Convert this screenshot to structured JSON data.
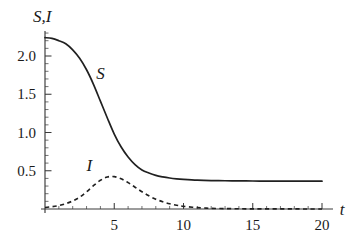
{
  "chart_data": {
    "type": "line",
    "title": "",
    "xlabel": "t",
    "ylabel": "S,I",
    "xlim": [
      0,
      20
    ],
    "ylim": [
      0,
      2.35
    ],
    "grid": false,
    "legend_position": "inline-annotations",
    "xticks": [
      5,
      10,
      15,
      20
    ],
    "xtick_labels": [
      "5",
      "10",
      "15",
      "20"
    ],
    "xminor_step": 1,
    "yticks": [
      0.5,
      1.0,
      1.5,
      2.0
    ],
    "ytick_labels": [
      "0.5",
      "1.0",
      "1.5",
      "2.0"
    ],
    "yminor_step": 0.1,
    "annotations": [
      {
        "text": "S",
        "x": 4.0,
        "y": 1.7
      },
      {
        "text": "I",
        "x": 3.2,
        "y": 0.5
      }
    ],
    "x": [
      0,
      0.5,
      1,
      1.5,
      2,
      2.5,
      3,
      3.5,
      4,
      4.5,
      5,
      5.5,
      6,
      6.5,
      7,
      7.5,
      8,
      8.5,
      9,
      9.5,
      10,
      11,
      12,
      13,
      14,
      15,
      16,
      17,
      18,
      19,
      20
    ],
    "series": [
      {
        "name": "S",
        "style": "solid",
        "color": "#202020",
        "values": [
          2.24,
          2.23,
          2.2,
          2.16,
          2.08,
          1.97,
          1.82,
          1.63,
          1.41,
          1.19,
          0.98,
          0.81,
          0.68,
          0.58,
          0.51,
          0.47,
          0.44,
          0.42,
          0.405,
          0.395,
          0.388,
          0.378,
          0.372,
          0.369,
          0.367,
          0.366,
          0.365,
          0.365,
          0.364,
          0.364,
          0.364
        ]
      },
      {
        "name": "I",
        "style": "dashed",
        "color": "#202020",
        "values": [
          0.02,
          0.03,
          0.045,
          0.07,
          0.105,
          0.155,
          0.225,
          0.305,
          0.375,
          0.418,
          0.423,
          0.395,
          0.345,
          0.285,
          0.225,
          0.172,
          0.128,
          0.094,
          0.068,
          0.049,
          0.035,
          0.018,
          0.009,
          0.005,
          0.003,
          0.002,
          0.001,
          0.001,
          0.001,
          0.0005,
          0.0005
        ]
      }
    ]
  },
  "figure": {
    "axis_y_label": "S,I",
    "axis_x_label": "t"
  }
}
